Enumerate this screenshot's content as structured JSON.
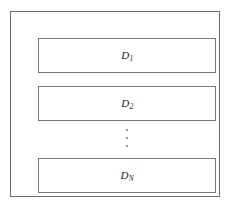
{
  "diagram": {
    "frame": {
      "name": "outer-container"
    },
    "blocks": [
      {
        "id": "block-1",
        "label_base": "D",
        "label_sub": "1",
        "label_full": "D1"
      },
      {
        "id": "block-2",
        "label_base": "D",
        "label_sub": "2",
        "label_full": "D2"
      },
      {
        "id": "block-3",
        "label_base": "D",
        "label_sub": "N",
        "label_full": "DN"
      }
    ],
    "ellipsis": {
      "name": "vertical-ellipsis",
      "symbol": "⋮",
      "dot_count": 3
    },
    "colors": {
      "background": "#ffffff",
      "outer_border": "#6e6e6e",
      "block_border": "#777777",
      "label_text": "#1a1a1a",
      "ellipsis_dot": "#8a8a8a"
    }
  }
}
